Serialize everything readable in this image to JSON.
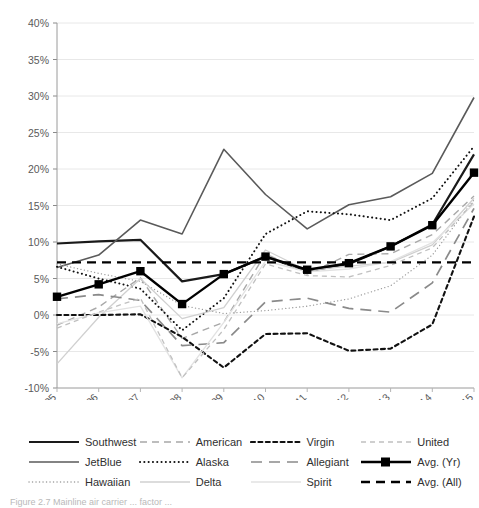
{
  "figure": {
    "caption": "Figure 2.7  Mainline air carrier ... factor ..."
  },
  "legend": {
    "items": [
      {
        "label": "Southwest",
        "style": "solid-thick",
        "color": "#1a1a1a"
      },
      {
        "label": "American",
        "style": "dashed-med",
        "color": "#a8a8a8"
      },
      {
        "label": "Virgin",
        "style": "dotted-dash-bold",
        "color": "#111111"
      },
      {
        "label": "United",
        "style": "dashed-thin",
        "color": "#c0c0c0"
      },
      {
        "label": "JetBlue",
        "style": "solid-med",
        "color": "#5a5a5a"
      },
      {
        "label": "Alaska",
        "style": "dotted-bold",
        "color": "#111111"
      },
      {
        "label": "Allegiant",
        "style": "dashed-long",
        "color": "#8a8a8a"
      },
      {
        "label": "Avg. (Yr)",
        "style": "marker-line",
        "color": "#000000"
      },
      {
        "label": "Hawaiian",
        "style": "dotted-thin",
        "color": "#9a9a9a"
      },
      {
        "label": "Delta",
        "style": "solid-thin",
        "color": "#d0d0d0"
      },
      {
        "label": "Spirit",
        "style": "solid-faint",
        "color": "#e2e2e2"
      },
      {
        "label": "Avg. (All)",
        "style": "dashed-bold",
        "color": "#000000"
      }
    ]
  },
  "chart_data": {
    "type": "line",
    "title": "",
    "xlabel": "",
    "ylabel": "",
    "grid": true,
    "legend_position": "bottom",
    "x": [
      "2005",
      "2006",
      "2007",
      "2008",
      "2009",
      "2010",
      "2011",
      "2012",
      "2013",
      "2014",
      "2015"
    ],
    "ylim": [
      -10,
      40
    ],
    "ytick_labels": [
      "-10%",
      "-5%",
      "0%",
      "5%",
      "10%",
      "15%",
      "20%",
      "25%",
      "30%",
      "35%",
      "40%"
    ],
    "ytick_values": [
      -10,
      -5,
      0,
      5,
      10,
      15,
      20,
      25,
      30,
      35,
      40
    ],
    "series": [
      {
        "name": "Southwest",
        "style": "solid-thick",
        "color": "#1a1a1a",
        "width": 2.2,
        "values": [
          9.8,
          10.1,
          10.3,
          4.6,
          5.6,
          8.0,
          6.0,
          7.0,
          9.4,
          12.4,
          22.0
        ]
      },
      {
        "name": "JetBlue",
        "style": "solid-med",
        "color": "#5a5a5a",
        "width": 1.6,
        "values": [
          6.5,
          8.2,
          13.0,
          11.1,
          22.7,
          16.5,
          11.8,
          15.1,
          16.2,
          19.4,
          29.8
        ]
      },
      {
        "name": "Hawaiian",
        "style": "dotted-thin",
        "color": "#9a9a9a",
        "width": 1.3,
        "values": [
          7.0,
          5.7,
          4.6,
          1.3,
          0.2,
          0.6,
          1.2,
          2.2,
          4.0,
          8.2,
          15.8
        ]
      },
      {
        "name": "American",
        "style": "dashed-med",
        "color": "#a8a8a8",
        "width": 1.4,
        "values": [
          -1.4,
          1.1,
          5.1,
          -3.2,
          -1.0,
          8.4,
          5.6,
          8.3,
          8.4,
          11.0,
          16.3
        ]
      },
      {
        "name": "Alaska",
        "style": "dotted-bold",
        "color": "#111111",
        "width": 2.0,
        "values": [
          6.6,
          5.0,
          3.6,
          -2.1,
          2.3,
          11.1,
          14.2,
          13.8,
          13.0,
          16.0,
          23.1
        ]
      },
      {
        "name": "Delta",
        "style": "solid-thin",
        "color": "#d0d0d0",
        "width": 1.3,
        "values": [
          -6.7,
          -0.3,
          5.0,
          -0.5,
          1.0,
          8.9,
          6.1,
          6.7,
          7.2,
          9.6,
          16.0
        ]
      },
      {
        "name": "Virgin",
        "style": "dotted-dash-bold",
        "color": "#111111",
        "width": 2.1,
        "values": [
          0.0,
          0.0,
          0.1,
          -3.0,
          -7.2,
          -2.6,
          -2.5,
          -4.9,
          -4.6,
          -1.3,
          13.5
        ]
      },
      {
        "name": "Allegiant",
        "style": "dashed-long",
        "color": "#8a8a8a",
        "width": 1.7,
        "values": [
          2.2,
          2.8,
          2.0,
          -4.2,
          -3.8,
          1.8,
          2.3,
          0.9,
          0.4,
          4.4,
          14.6
        ]
      },
      {
        "name": "Spirit",
        "style": "solid-faint",
        "color": "#e2e2e2",
        "width": 1.3,
        "values": [
          -1.2,
          0.3,
          1.2,
          -8.6,
          -1.0,
          7.4,
          5.9,
          6.3,
          7.3,
          9.9,
          15.2
        ]
      },
      {
        "name": "United",
        "style": "dashed-thin",
        "color": "#c0c0c0",
        "width": 1.3,
        "values": [
          -1.8,
          0.4,
          2.3,
          -8.6,
          -2.0,
          7.0,
          5.4,
          5.2,
          6.8,
          9.2,
          15.5
        ]
      },
      {
        "name": "Avg. (Yr)",
        "style": "marker-line",
        "color": "#000000",
        "width": 2.4,
        "values": [
          2.5,
          4.2,
          6.0,
          1.5,
          5.6,
          8.0,
          6.2,
          7.1,
          9.4,
          12.3,
          19.5
        ]
      },
      {
        "name": "Avg. (All)",
        "style": "dashed-bold",
        "color": "#000000",
        "width": 2.4,
        "values": [
          7.2,
          7.2,
          7.2,
          7.2,
          7.2,
          7.2,
          7.2,
          7.2,
          7.2,
          7.2,
          7.2
        ]
      }
    ]
  }
}
